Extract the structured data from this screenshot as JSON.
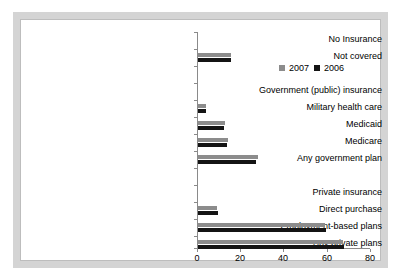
{
  "chart_data": {
    "type": "bar",
    "orientation": "horizontal",
    "title": "",
    "xlabel": "",
    "ylabel": "",
    "xlim": [
      0,
      80
    ],
    "xticks": [
      0,
      20,
      40,
      60,
      80
    ],
    "grid": false,
    "legend_position": "top-right",
    "categories": [
      "No Insurance",
      "Not covered",
      "",
      "Government (public) insurance",
      "Military health care",
      "Medicaid",
      "Medicare",
      "Any government plan",
      "",
      "Private insurance",
      "Direct purchase",
      "Employment-based plans",
      "Any private plans"
    ],
    "series": [
      {
        "name": "2007",
        "color": "#8c8c8c",
        "values": [
          null,
          15.3,
          null,
          null,
          3.7,
          12.5,
          13.8,
          27.8,
          null,
          null,
          8.9,
          59.3,
          67.5
        ]
      },
      {
        "name": "2006",
        "color": "#141414",
        "values": [
          null,
          15.2,
          null,
          null,
          3.6,
          12.3,
          13.6,
          27.0,
          null,
          null,
          9.1,
          59.7,
          67.9
        ]
      }
    ],
    "legend": [
      "2007",
      "2006"
    ]
  },
  "legend": {
    "entries": [
      {
        "label": "2007",
        "swatch": "s2007"
      },
      {
        "label": "2006",
        "swatch": "s2006"
      }
    ]
  },
  "axis": {
    "x_tick_labels": [
      "0",
      "20",
      "40",
      "60",
      "80"
    ]
  },
  "labels": {
    "row0": "No Insurance",
    "row1": "Not covered",
    "row3": "Government (public) insurance",
    "row4": "Military health care",
    "row5": "Medicaid",
    "row6": "Medicare",
    "row7": "Any government plan",
    "row9": "Private insurance",
    "row10": "Direct purchase",
    "row11": "Employment-based plans",
    "row12": "Any private plans"
  }
}
